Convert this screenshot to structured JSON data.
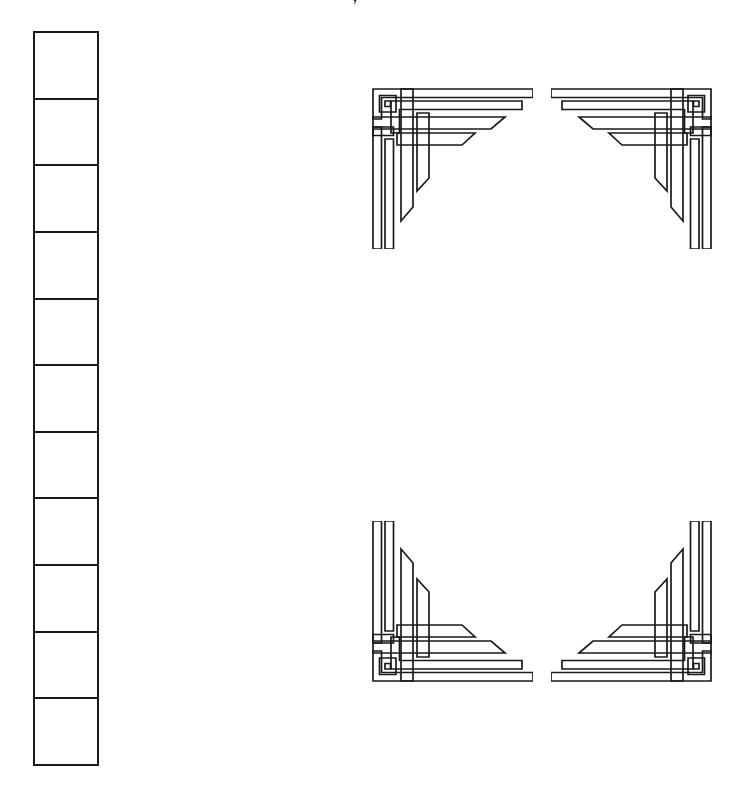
{
  "page": {
    "background_color": "#ffffff",
    "line_color": "#1a1a1a",
    "width": 737,
    "height": 787
  },
  "top_glyph": {
    "text": "y",
    "description": "clipped-text-descender"
  },
  "grid_column": {
    "label": "single column grid",
    "cell_count": 11,
    "cells": [
      {
        "text": ""
      },
      {
        "text": ""
      },
      {
        "text": ""
      },
      {
        "text": ""
      },
      {
        "text": ""
      },
      {
        "text": ""
      },
      {
        "text": ""
      },
      {
        "text": ""
      },
      {
        "text": ""
      },
      {
        "text": ""
      },
      {
        "text": ""
      }
    ]
  },
  "ornament_frame": {
    "label": "art deco corner frame",
    "corners": [
      {
        "name": "top-left",
        "icon": "deco-corner-icon"
      },
      {
        "name": "top-right",
        "icon": "deco-corner-icon"
      },
      {
        "name": "bottom-left",
        "icon": "deco-corner-icon"
      },
      {
        "name": "bottom-right",
        "icon": "deco-corner-icon"
      }
    ]
  }
}
